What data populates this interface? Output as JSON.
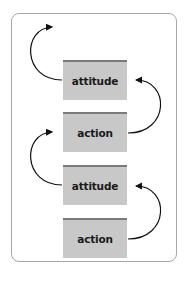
{
  "diagram": {
    "boxes": [
      {
        "label": "attitude"
      },
      {
        "label": "action"
      },
      {
        "label": "attitude"
      },
      {
        "label": "action"
      }
    ],
    "colors": {
      "box_fill": "#c8c8c8",
      "box_top": "#7a7a7a",
      "frame": "#a8a8a8",
      "arrow": "#111111"
    }
  }
}
